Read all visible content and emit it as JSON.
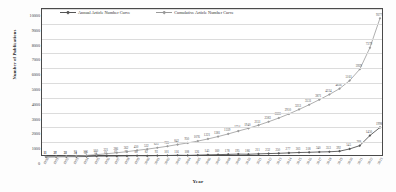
{
  "chart_data": {
    "type": "line",
    "title": "",
    "xlabel": "Year",
    "ylabel": "Number of Publications",
    "ylim": [
      0,
      10000
    ],
    "ytick_labels": [
      "10000",
      "9000",
      "8000",
      "7000",
      "6000",
      "5000",
      "4000",
      "3000",
      "2000",
      "1000",
      "0"
    ],
    "grid": true,
    "legend_position": "top-center",
    "categories": [
      "1990",
      "1991",
      "1992",
      "1993",
      "1994",
      "1995",
      "1996",
      "1997",
      "1998",
      "1999",
      "2000",
      "2001",
      "2002",
      "2003",
      "2004",
      "2005",
      "2006",
      "2007",
      "2008",
      "2009",
      "2010",
      "2011",
      "2012",
      "2013",
      "2014",
      "2015",
      "2016",
      "2017",
      "2018",
      "2019",
      "2020",
      "2021",
      "2022",
      "2023"
    ],
    "series": [
      {
        "name": "Annual Article Number Curve",
        "marker": "diamond",
        "color": "#555555",
        "values": [
          11,
          17,
          22,
          24,
          32,
          54,
          61,
          65,
          76,
          88,
          82,
          93,
          101,
          116,
          108,
          126,
          145,
          160,
          178,
          195,
          186,
          211,
          232,
          250,
          277,
          303,
          318,
          340,
          353,
          392,
          545,
          768,
          1450,
          1998
        ]
      },
      {
        "name": "Cumulative Article Number Curve",
        "marker": "diamond",
        "color": "#9a9a9a",
        "values": [
          11,
          28,
          50,
          74,
          106,
          160,
          221,
          286,
          362,
          450,
          532,
          625,
          726,
          842,
          950,
          1076,
          1221,
          1381,
          1559,
          1754,
          1940,
          2151,
          2383,
          2633,
          2910,
          3213,
          3531,
          3871,
          4224,
          4616,
          5161,
          5929,
          7379,
          9377
        ]
      }
    ],
    "annual_labels": [
      "11",
      "17",
      "22",
      "24",
      "32",
      "54",
      "61",
      "65",
      "76",
      "88",
      "82",
      "93",
      "101",
      "116",
      "108",
      "126",
      "145",
      "160",
      "178",
      "195",
      "186",
      "211",
      "232",
      "250",
      "277",
      "303",
      "318",
      "340",
      "353",
      "392",
      "545",
      "768",
      "1450",
      "1998"
    ],
    "cumulative_labels": [
      "11",
      "28",
      "50",
      "74",
      "106",
      "160",
      "221",
      "286",
      "362",
      "450",
      "532",
      "625",
      "726",
      "842",
      "950",
      "1076",
      "1221",
      "1381",
      "1559",
      "1754",
      "1940",
      "2151",
      "2383",
      "2633",
      "2910",
      "3213",
      "3531",
      "3871",
      "4224",
      "4616",
      "5161",
      "5929",
      "7379",
      "9377"
    ]
  },
  "legend": {
    "annual": "Annual Article Number Curve",
    "cumulative": "Cumulative Article Number Curve"
  },
  "axes": {
    "x_title": "Year",
    "y_title": "Number of Publications"
  }
}
